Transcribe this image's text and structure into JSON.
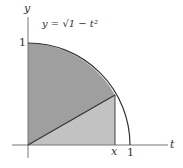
{
  "figure": {
    "axes": {
      "horizontal_label": "t",
      "vertical_label": "y"
    },
    "ticks": {
      "y_one": "1",
      "t_one": "1",
      "t_x": "x"
    },
    "curve_label": "y = √1 − t²",
    "colors": {
      "sector_fill": "#9f9f9f",
      "triangle_fill": "#c2c2c2",
      "stroke": "#333333",
      "axis": "#777777"
    }
  }
}
